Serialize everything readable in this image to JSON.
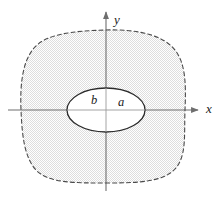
{
  "figure": {
    "canvas": {
      "width": 224,
      "height": 206,
      "background": "#ffffff"
    },
    "axes": {
      "x_axis": {
        "label": "x",
        "label_x": 209,
        "label_y": 110,
        "line_y": 110,
        "line_x_start": 8,
        "line_x_end": 190,
        "arrow_tip_x": 198,
        "color": "#6e6e6e"
      },
      "y_axis": {
        "label": "y",
        "label_x": 117,
        "label_y": 21,
        "line_x": 106,
        "line_y_start": 191,
        "line_y_end": 21,
        "arrow_tip_y": 12,
        "color": "#6e6e6e"
      },
      "origin": {
        "x": 106,
        "y": 110
      }
    },
    "outer_region": {
      "name": "shaded-region",
      "stroke_style": "dashed",
      "stroke_color": "#4a4a4a",
      "stroke_width": 1.1,
      "dash_pattern": "4,3",
      "fill": "#ededed",
      "fill_texture": "stipple",
      "path": "M 106 30 C 140 29 164 36 175 50 C 186 64 186 86 185 110 C 184 134 187 156 175 169 C 163 182 138 183 106 183 C 74 183 48 183 36 170 C 24 157 22 134 21 110 C 20 86 22 62 34 48 C 46 34 72 31 106 30 Z"
    },
    "inner_ellipse": {
      "name": "inner-ellipse",
      "center_x": 106,
      "center_y": 110,
      "radius_x": 39,
      "radius_y": 22,
      "stroke_color": "#2b2b2b",
      "stroke_width": 1.3,
      "fill": "#ffffff"
    },
    "labels": [
      {
        "text": "b",
        "x": 94,
        "y": 101,
        "name": "label-b"
      },
      {
        "text": "a",
        "x": 121,
        "y": 103,
        "name": "label-a"
      }
    ],
    "colors": {
      "axis": "#6e6e6e",
      "outer_curve": "#4a4a4a",
      "inner_curve": "#2b2b2b",
      "shading": "#ededed",
      "text": "#1a1a1a",
      "background": "#ffffff"
    }
  }
}
